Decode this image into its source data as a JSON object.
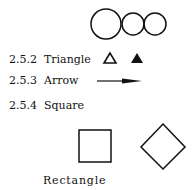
{
  "sections": [
    {
      "number": "2.5.2",
      "title": "Triangle"
    },
    {
      "number": "2.5.3",
      "title": "Arrow"
    },
    {
      "number": "2.5.4",
      "title": "Square"
    }
  ],
  "captions": {
    "rectangle": "Rectangle"
  },
  "shapes": {
    "circles": [
      "large-circle",
      "small-circle",
      "small-circle"
    ],
    "triangles": [
      "outline-triangle",
      "filled-triangle"
    ],
    "arrow": "right-arrow",
    "squares": [
      "square",
      "diamond"
    ]
  },
  "colors": {
    "stroke": "#111111",
    "background": "#ffffff"
  }
}
